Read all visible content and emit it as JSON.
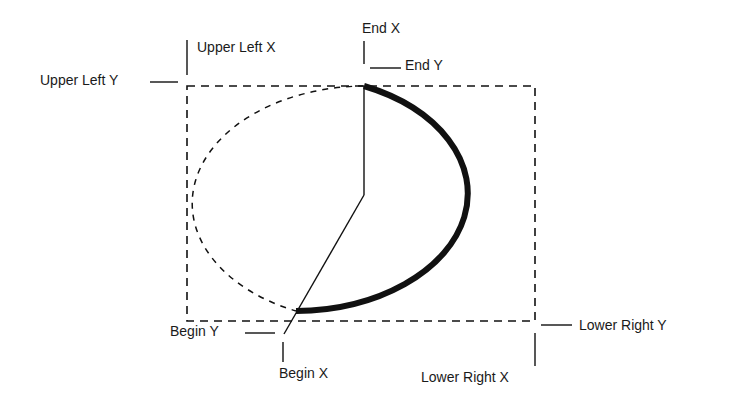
{
  "diagram": {
    "type": "arc-parameters",
    "labels": {
      "upper_left_x": "Upper Left X",
      "upper_left_y": "Upper Left Y",
      "end_x": "End X",
      "end_y": "End Y",
      "begin_x": "Begin X",
      "begin_y": "Begin Y",
      "lower_right_x": "Lower Right X",
      "lower_right_y": "Lower Right Y"
    },
    "colors": {
      "line": "#111111",
      "text": "#1a1a1a",
      "background": "#ffffff"
    }
  }
}
